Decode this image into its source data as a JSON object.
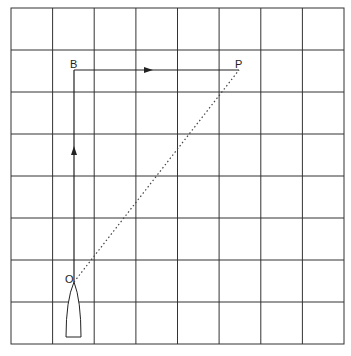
{
  "diagram": {
    "grid": {
      "cols": 8,
      "rows": 8,
      "x0": 11,
      "y0": 8,
      "x1": 344,
      "y1": 344,
      "color": "#333333"
    },
    "points": {
      "O": {
        "label": "O",
        "x": 74,
        "y": 282
      },
      "B": {
        "label": "B",
        "x": 74,
        "y": 70
      },
      "P": {
        "label": "P",
        "x": 239,
        "y": 70
      }
    },
    "paths": [
      {
        "name": "O-to-B",
        "style": "solid",
        "arrow": "up"
      },
      {
        "name": "B-to-P",
        "style": "solid",
        "arrow": "right"
      },
      {
        "name": "O-to-P",
        "style": "dotted",
        "arrow": "none"
      }
    ],
    "boat": {
      "label": "boat"
    }
  }
}
